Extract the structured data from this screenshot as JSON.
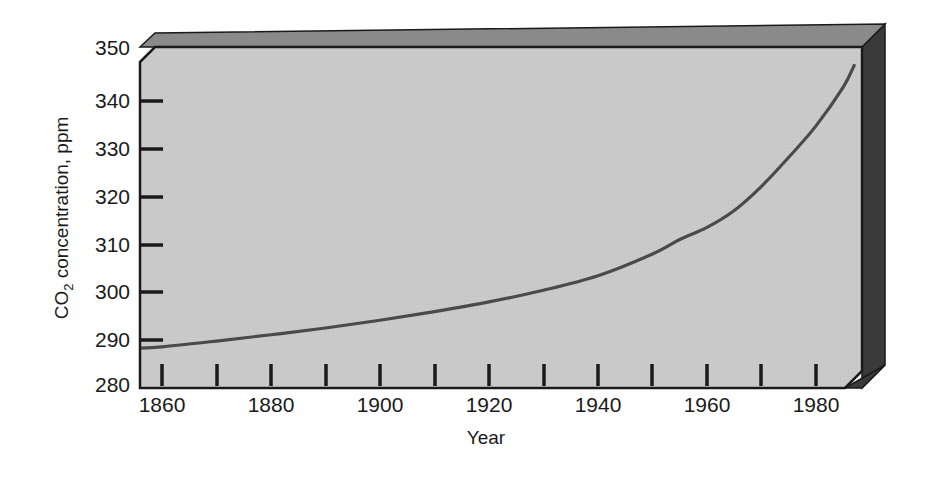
{
  "chart_data": {
    "type": "line",
    "title": "",
    "xlabel": "Year",
    "ylabel": "CO2 concentration, ppm",
    "ylabel_main": "CO",
    "ylabel_sub": "2",
    "ylabel_rest": " concentration, ppm",
    "xlim": [
      1855,
      1988
    ],
    "ylim": [
      280,
      350
    ],
    "grid": false,
    "legend": null,
    "x_tick_labels": [
      "1860",
      "1880",
      "1900",
      "1920",
      "1940",
      "1960",
      "1980"
    ],
    "x_tick_values": [
      1860,
      1880,
      1900,
      1920,
      1940,
      1960,
      1980
    ],
    "x_minor_ticks": [
      1870,
      1890,
      1910,
      1930,
      1950,
      1970
    ],
    "y_tick_labels": [
      "280",
      "290",
      "300",
      "310",
      "320",
      "330",
      "340",
      "350"
    ],
    "y_tick_values": [
      280,
      290,
      300,
      310,
      320,
      330,
      340,
      350
    ],
    "series": [
      {
        "name": "CO2 concentration",
        "x": [
          1855,
          1860,
          1870,
          1880,
          1890,
          1900,
          1910,
          1920,
          1930,
          1940,
          1950,
          1955,
          1960,
          1965,
          1970,
          1975,
          1980,
          1985,
          1987
        ],
        "values": [
          288.0,
          288.3,
          289.5,
          290.8,
          292.2,
          293.8,
          295.6,
          297.6,
          300.0,
          303.0,
          307.5,
          310.5,
          313.0,
          316.5,
          321.5,
          327.5,
          334.0,
          342.0,
          346.5
        ]
      }
    ],
    "colors": {
      "plot_background": "#c9c9c9",
      "shadow": "#3a3a3a",
      "line": "#4a4a4a",
      "frame": "#1a1a1a",
      "page_background": "#ffffff"
    }
  },
  "figure": {
    "axis_x_label": "Year",
    "axis_y_label_main": "CO",
    "axis_y_label_sub": "2",
    "axis_y_label_rest": " concentration, ppm"
  }
}
